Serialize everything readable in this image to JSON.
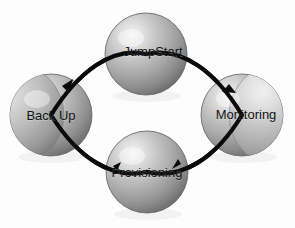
{
  "diagram": {
    "type": "cycle",
    "background_color": "#fdfdfd",
    "connector_color": "#0a0a0a",
    "label_color": "#121212",
    "sphere": {
      "fill_light": "#eeeeee",
      "fill_mid": "#b4b4b4",
      "fill_dark": "#6f6f6f",
      "edge": "#5a5a5a",
      "highlight": "#f2f2f2"
    },
    "nodes": [
      {
        "id": "jumpstart",
        "label": "JumpStart",
        "position": "top",
        "cx": 146,
        "cy": 54,
        "r": 41,
        "label_x": 153,
        "label_y": 51
      },
      {
        "id": "monitoring",
        "label": "Monitoring",
        "position": "right",
        "cx": 242,
        "cy": 115,
        "r": 41,
        "label_x": 246,
        "label_y": 114
      },
      {
        "id": "provisioning",
        "label": "Provisioning",
        "position": "bottom",
        "cx": 147,
        "cy": 172,
        "r": 41,
        "label_x": 147,
        "label_y": 172
      },
      {
        "id": "backup",
        "label": "Back Up",
        "position": "left",
        "cx": 51,
        "cy": 115,
        "r": 41,
        "label_x": 51,
        "label_y": 115
      }
    ],
    "connectors": [
      {
        "id": "jumpstart-to-monitoring",
        "from": "jumpstart",
        "to": "monitoring",
        "has_arrow": false
      },
      {
        "id": "monitoring-to-provisioning",
        "from": "monitoring",
        "to": "provisioning",
        "has_arrow": true
      },
      {
        "id": "provisioning-to-backup",
        "from": "provisioning",
        "to": "backup",
        "has_arrow": true
      },
      {
        "id": "backup-to-jumpstart",
        "from": "backup",
        "to": "jumpstart",
        "has_arrow": true
      }
    ]
  }
}
